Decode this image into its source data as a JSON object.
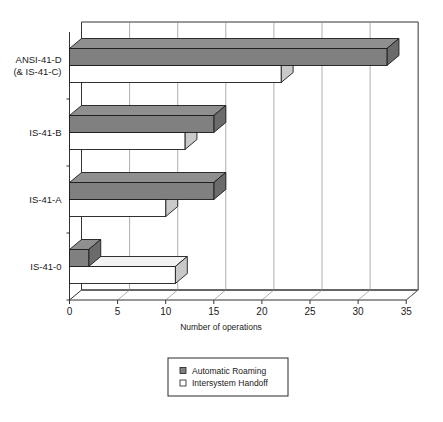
{
  "chart_data": {
    "type": "bar",
    "orientation": "horizontal",
    "style": "3d-grouped-horizontal-bar",
    "title": "",
    "xlabel": "Number of operations",
    "ylabel": "",
    "categories": [
      "ANSI-41-D\n(& IS-41-C)",
      "IS-41-B",
      "IS-41-A",
      "IS-41-0"
    ],
    "category_labels": [
      {
        "line1": "ANSI-41-D",
        "line2": "(& IS-41-C)"
      },
      {
        "line1": "IS-41-B",
        "line2": ""
      },
      {
        "line1": "IS-41-A",
        "line2": ""
      },
      {
        "line1": "IS-41-0",
        "line2": ""
      }
    ],
    "series": [
      {
        "name": "Automatic Roaming",
        "color": "#808080",
        "values": [
          33,
          15,
          15,
          2
        ]
      },
      {
        "name": "Intersystem Handoff",
        "color": "#ffffff",
        "values": [
          22,
          12,
          10,
          11
        ]
      }
    ],
    "xlim": [
      0,
      35
    ],
    "xticks": [
      0,
      5,
      10,
      15,
      20,
      25,
      30,
      35
    ],
    "xtick_labels": [
      "0",
      "5",
      "10",
      "15",
      "20",
      "25",
      "30",
      "35"
    ],
    "grid": true,
    "grid_axis": "x",
    "legend": {
      "position": "bottom",
      "entries": [
        {
          "label": "Automatic Roaming",
          "swatch": "filled-gray-square"
        },
        {
          "label": "Intersystem Handoff",
          "swatch": "hollow-white-square"
        }
      ]
    }
  },
  "colors": {
    "bar_front_roaming": "#808080",
    "bar_top_roaming": "#8f8f8f",
    "bar_side_roaming": "#6b6b6b",
    "bar_front_handoff": "#ffffff",
    "bar_top_handoff": "#f2f2f2",
    "bar_side_handoff": "#c9c9c9",
    "grid": "#8c8c8c",
    "frame": "#333333",
    "text": "#1a1a1a",
    "background": "#ffffff"
  }
}
